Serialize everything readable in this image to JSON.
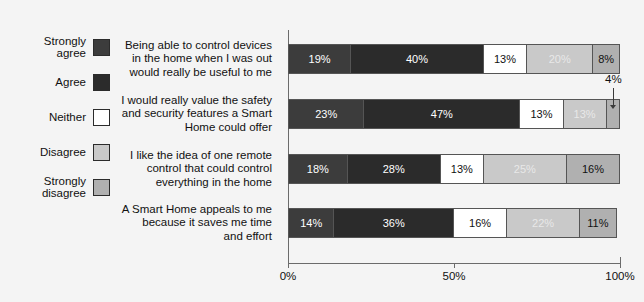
{
  "chart_data": {
    "type": "bar",
    "orientation": "horizontal",
    "stacked": true,
    "normalized_percent": true,
    "title": "",
    "xlabel": "",
    "ylabel": "",
    "xlim": [
      0,
      100
    ],
    "grid": false,
    "legend_position": "left",
    "tick_labels": [
      "0%",
      "50%",
      "100%"
    ],
    "tick_values": [
      0,
      50,
      100
    ],
    "categories": [
      "Being able to control devices in the home when I was out would really be useful to me",
      "I would really value the safety and security features a Smart Home could offer",
      "I like the idea of one remote control that could control everything in the home",
      "A Smart Home appeals to me because it saves me time and effort"
    ],
    "series": [
      {
        "name": "Strongly agree",
        "color": "#3c3c3c",
        "text_color": "#ffffff",
        "values": [
          19,
          23,
          18,
          14
        ]
      },
      {
        "name": "Agree",
        "color": "#2b2b2b",
        "text_color": "#ffffff",
        "values": [
          40,
          47,
          28,
          36
        ]
      },
      {
        "name": "Neither",
        "color": "#ffffff",
        "text_color": "#111111",
        "values": [
          13,
          13,
          13,
          16
        ]
      },
      {
        "name": "Disagree",
        "color": "#c9c9c9",
        "text_color": "#e8e8e8",
        "values": [
          20,
          13,
          25,
          22
        ]
      },
      {
        "name": "Strongly disagree",
        "color": "#b0b0b0",
        "text_color": "#111111",
        "values": [
          8,
          4,
          16,
          11
        ]
      }
    ],
    "data_labels": [
      [
        "19%",
        "40%",
        "13%",
        "20%",
        "8%"
      ],
      [
        "23%",
        "47%",
        "13%",
        "13%",
        "4%"
      ],
      [
        "18%",
        "28%",
        "13%",
        "25%",
        "16%"
      ],
      [
        "14%",
        "36%",
        "16%",
        "22%",
        "11%"
      ]
    ],
    "annotations": [
      {
        "text": "4%",
        "series": "Strongly disagree",
        "category_index": 1,
        "reason": "segment too narrow for inline label; leader line points down into the bar"
      }
    ]
  },
  "legend": {
    "items": [
      {
        "label": "Strongly\nagree",
        "color": "#3c3c3c"
      },
      {
        "label": "Agree",
        "color": "#2b2b2b"
      },
      {
        "label": "Neither",
        "color": "#ffffff"
      },
      {
        "label": "Disagree",
        "color": "#c9c9c9"
      },
      {
        "label": "Strongly\ndisagree",
        "color": "#b0b0b0"
      }
    ]
  },
  "axis": {
    "ticks": [
      {
        "label": "0%",
        "value": 0
      },
      {
        "label": "50%",
        "value": 50
      },
      {
        "label": "100%",
        "value": 100
      }
    ]
  }
}
